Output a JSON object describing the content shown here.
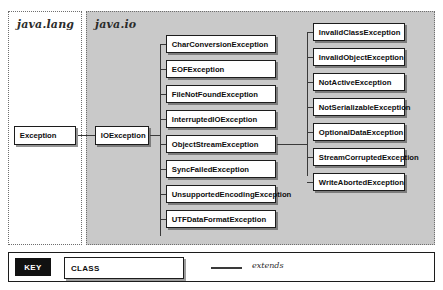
{
  "diagram": {
    "packages": [
      {
        "id": "java-lang",
        "label": "java.lang",
        "background": "#ffffff"
      },
      {
        "id": "java-io",
        "label": "java.io",
        "background": "#c9c9c9"
      }
    ],
    "root": {
      "label": "Exception",
      "package": "java.lang"
    },
    "level1": {
      "label": "IOException",
      "package": "java.io",
      "extends": "Exception"
    },
    "ioexception_subclasses": [
      "CharConversionException",
      "EOFException",
      "FileNotFoundException",
      "InterruptedIOException",
      "ObjectStreamException",
      "SyncFailedException",
      "UnsupportedEncodingException",
      "UTFDataFormatException"
    ],
    "objectstreamexception_subclasses": [
      "InvalidClassException",
      "InvalidObjectException",
      "NotActiveException",
      "NotSerializableException",
      "OptionalDataException",
      "StreamCorruptedException",
      "WriteAbortedException"
    ]
  },
  "key": {
    "badge_label": "KEY",
    "class_label": "CLASS",
    "relation_label": "extends"
  },
  "colors": {
    "panel_io_background": "#c9c9c9",
    "panel_lang_background": "#ffffff",
    "box_background": "#ffffff",
    "box_border": "#1c1c1c",
    "line": "#3a3a3a",
    "key_badge_background": "#111111"
  }
}
